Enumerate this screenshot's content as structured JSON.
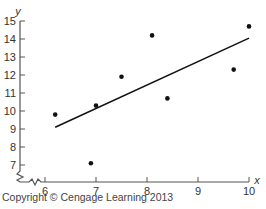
{
  "chart_data": {
    "type": "scatter",
    "title": "",
    "xlabel": "x",
    "ylabel": "y",
    "xlim": [
      5.5,
      10
    ],
    "ylim": [
      6,
      15
    ],
    "x_ticks": [
      6,
      7,
      8,
      9,
      10
    ],
    "y_ticks": [
      7,
      8,
      9,
      10,
      11,
      12,
      13,
      14,
      15
    ],
    "axis_breaks": [
      "x",
      "y"
    ],
    "grid": false,
    "legend": null,
    "series": [
      {
        "name": "data",
        "x": [
          6.2,
          7.0,
          6.9,
          7.5,
          8.1,
          8.4,
          9.7,
          10.0
        ],
        "y": [
          9.8,
          10.3,
          7.1,
          11.9,
          14.2,
          10.7,
          12.3,
          14.7
        ]
      }
    ],
    "regression_line": {
      "x": [
        6.2,
        10.0
      ],
      "y": [
        9.1,
        14.05
      ]
    }
  },
  "footer": {
    "copyright": "Copyright © Cengage Learning 2013"
  }
}
